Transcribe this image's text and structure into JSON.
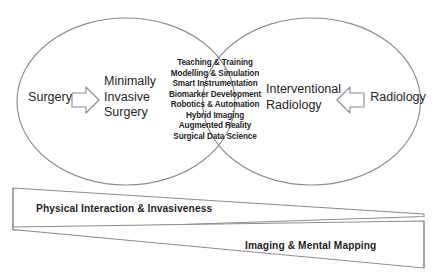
{
  "diagram": {
    "left_ellipse": {
      "source_label": "Surgery",
      "target_label": "Minimally\nInvasive\nSurgery",
      "arrow": "arrow-right-icon"
    },
    "right_ellipse": {
      "source_label": "Radiology",
      "target_label": "Interventional\nRadiology",
      "arrow": "arrow-left-icon"
    },
    "overlap_topics": [
      "Teaching & Training",
      "Modelling & Simulation",
      "Smart Instrumentation",
      "Biomarker Development",
      "Robotics & Automation",
      "Hybrid Imaging",
      "Augmented Reality",
      "Surgical Data Science"
    ],
    "gradient_bands": [
      {
        "label": "Physical Interaction & Invasiveness",
        "direction": "decreasing-left-to-right"
      },
      {
        "label": "Imaging & Mental Mapping",
        "direction": "increasing-left-to-right"
      }
    ],
    "colors": {
      "stroke": "#8c8c8c",
      "text": "#262626",
      "background": "#ffffff"
    }
  }
}
